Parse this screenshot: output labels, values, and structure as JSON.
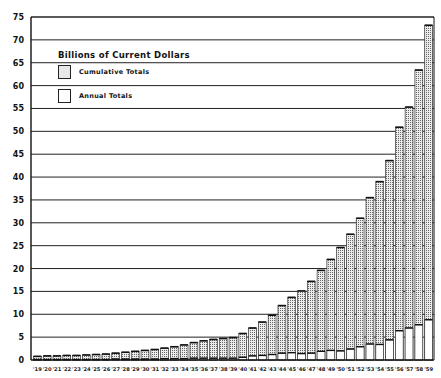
{
  "chart_data": {
    "type": "bar",
    "subtype": "overlapping-stacked",
    "title": "Billions of Current Dollars",
    "xlabel": "",
    "ylabel": "",
    "ylim": [
      0,
      75
    ],
    "yticks": [
      0,
      5,
      10,
      15,
      20,
      25,
      30,
      35,
      40,
      45,
      50,
      55,
      60,
      65,
      70,
      75
    ],
    "grid": true,
    "legend_position": "upper-left",
    "categories": [
      "'19",
      "'20",
      "'21",
      "'22",
      "'23",
      "'24",
      "'25",
      "'26",
      "'27",
      "'28",
      "'29",
      "'30",
      "'31",
      "'32",
      "'33",
      "'34",
      "'35",
      "'36",
      "'37",
      "'38",
      "'39",
      "'40",
      "'41",
      "'42",
      "'43",
      "'44",
      "'45",
      "'46",
      "'47",
      "'48",
      "'49",
      "'50",
      "'51",
      "'52",
      "'53",
      "'54",
      "'55",
      "'56",
      "'57",
      "'58",
      "'59"
    ],
    "series": [
      {
        "name": "Cumulative Totals",
        "pattern": "stippled",
        "values": [
          0.8,
          0.9,
          0.9,
          1.0,
          1.0,
          1.1,
          1.2,
          1.3,
          1.5,
          1.7,
          1.9,
          2.1,
          2.3,
          2.6,
          2.9,
          3.3,
          3.8,
          4.2,
          4.5,
          4.7,
          4.9,
          5.8,
          7.0,
          8.3,
          9.8,
          11.9,
          13.7,
          15.1,
          17.2,
          19.6,
          22.0,
          24.6,
          27.5,
          31.0,
          35.5,
          39.0,
          43.6,
          50.9,
          55.3,
          63.4,
          73.2
        ]
      },
      {
        "name": "Annual Totals",
        "pattern": "white",
        "values": [
          0.1,
          0.1,
          0.1,
          0.1,
          0.1,
          0.1,
          0.1,
          0.1,
          0.2,
          0.2,
          0.2,
          0.2,
          0.2,
          0.3,
          0.3,
          0.3,
          0.4,
          0.4,
          0.4,
          0.4,
          0.4,
          0.6,
          0.9,
          1.0,
          1.2,
          1.5,
          1.6,
          1.4,
          1.5,
          1.9,
          2.1,
          2.0,
          2.4,
          2.9,
          3.5,
          3.4,
          4.4,
          6.4,
          7.0,
          7.7,
          8.8
        ]
      }
    ]
  },
  "legend": {
    "title": "Billions of Current Dollars",
    "items": [
      {
        "label": "Cumulative Totals"
      },
      {
        "label": "Annual Totals"
      }
    ]
  }
}
